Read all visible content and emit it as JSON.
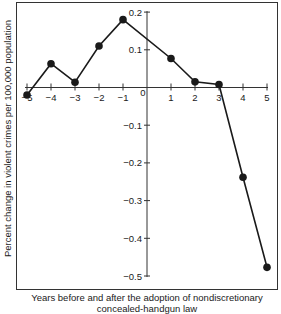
{
  "chart_data": {
    "type": "line",
    "title": "",
    "xlabel_line1": "Years before and after the adoption of nondiscretionary",
    "xlabel_line2": "concealed-handgun law",
    "ylabel": "Percent change in violent crimes per 100,000 population",
    "x": [
      -5,
      -4,
      -3,
      -2,
      -1,
      1,
      2,
      3,
      4,
      5
    ],
    "series": [
      {
        "name": "Violent crimes",
        "values": [
          -0.02,
          0.063,
          0.014,
          0.11,
          0.18,
          0.077,
          0.015,
          0.008,
          -0.238,
          -0.477
        ]
      }
    ],
    "xticks": [
      -5,
      -4,
      -3,
      -2,
      -1,
      0,
      1,
      2,
      3,
      4,
      5
    ],
    "yticks": [
      0.2,
      0.1,
      -0.1,
      -0.2,
      -0.3,
      -0.4,
      -0.5
    ],
    "ytick_labels": [
      "0.2",
      "0.1",
      "−0.1",
      "−0.2",
      "−0.3",
      "−0.4",
      "−0.5"
    ],
    "xtick_labels": [
      "−5",
      "−4",
      "−3",
      "−2",
      "−1",
      "0",
      "1",
      "2",
      "3",
      "4",
      "5"
    ],
    "xlim": [
      -5,
      5
    ],
    "ylim": [
      -0.5,
      0.2
    ],
    "grid": false,
    "legend": "none",
    "line_color": "#1a1a1a",
    "marker_color": "#1a1a1a"
  }
}
